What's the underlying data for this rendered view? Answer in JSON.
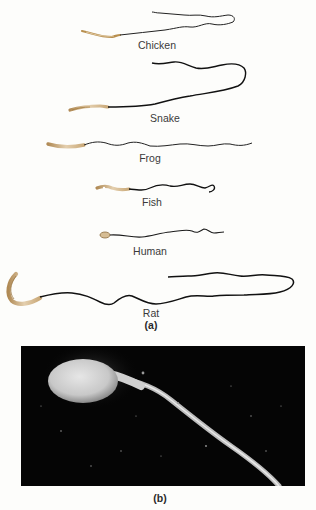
{
  "figure": {
    "panel_a": {
      "label": "(a)",
      "species": [
        {
          "name": "Chicken"
        },
        {
          "name": "Snake"
        },
        {
          "name": "Frog"
        },
        {
          "name": "Fish"
        },
        {
          "name": "Human"
        },
        {
          "name": "Rat"
        }
      ]
    },
    "panel_b": {
      "label": "(b)"
    },
    "colors": {
      "head": "#c9a877",
      "tail": "#1a1a1a",
      "photo_background": "#050505"
    }
  }
}
